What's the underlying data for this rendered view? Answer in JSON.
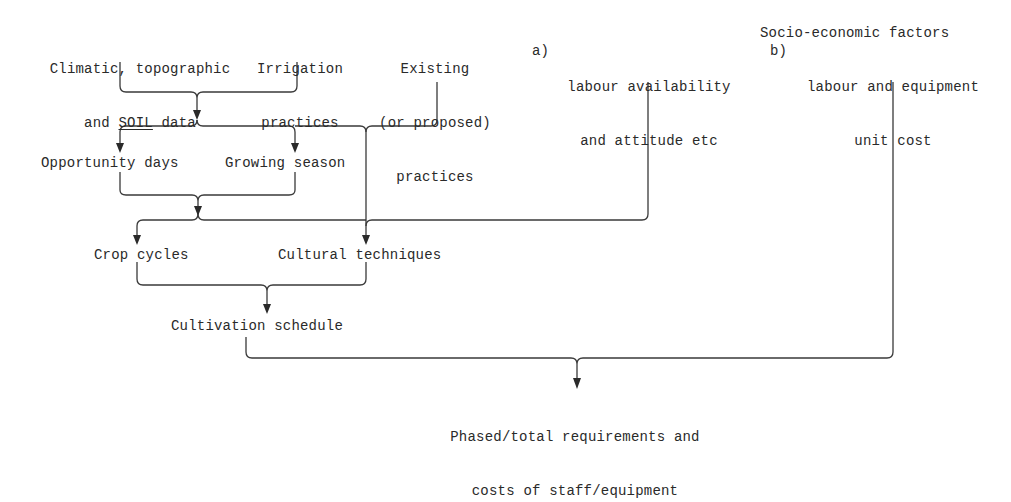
{
  "diagram": {
    "type": "flowchart",
    "inputs": {
      "climatic": {
        "line1": "Climatic, topographic",
        "line2_prefix": "and ",
        "line2_underlined": "SOIL",
        "line2_suffix": " data"
      },
      "irrigation": {
        "line1": "Irrigation",
        "line2": "practices"
      },
      "existing": {
        "line1": "Existing",
        "line2": "(or proposed)",
        "line3": "practices"
      },
      "socio_economic": {
        "title": "Socio-economic factors",
        "a_marker": "a)",
        "a_line1": "labour availability",
        "a_line2": "and attitude etc",
        "b_marker": "b)",
        "b_line1": "labour and equipment",
        "b_line2": "unit cost"
      }
    },
    "intermediate": {
      "opportunity_days": "Opportunity days",
      "growing_season": "Growing season",
      "crop_cycles": "Crop cycles",
      "cultural_techniques": "Cultural techniques",
      "cultivation_schedule": "Cultivation schedule"
    },
    "output": {
      "line1": "Phased/total requirements and",
      "line2": "costs of staff/equipment"
    },
    "edges": [
      [
        "Climatic, topographic and SOIL data",
        "Opportunity days"
      ],
      [
        "Climatic, topographic and SOIL data",
        "Growing season"
      ],
      [
        "Irrigation practices",
        "Opportunity days"
      ],
      [
        "Irrigation practices",
        "Growing season"
      ],
      [
        "Existing (or proposed) practices",
        "Cultural techniques"
      ],
      [
        "Opportunity days",
        "Crop cycles"
      ],
      [
        "Opportunity days",
        "Cultural techniques"
      ],
      [
        "Growing season",
        "Crop cycles"
      ],
      [
        "Growing season",
        "Cultural techniques"
      ],
      [
        "labour availability and attitude etc",
        "Cultural techniques"
      ],
      [
        "Crop cycles",
        "Cultivation schedule"
      ],
      [
        "Cultural techniques",
        "Cultivation schedule"
      ],
      [
        "Cultivation schedule",
        "Phased/total requirements and costs of staff/equipment"
      ],
      [
        "labour and equipment unit cost",
        "Phased/total requirements and costs of staff/equipment"
      ]
    ]
  }
}
